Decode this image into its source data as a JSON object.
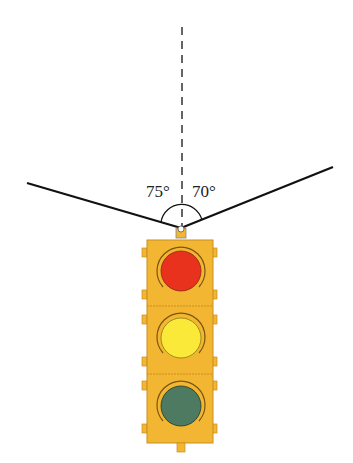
{
  "diagram": {
    "title": "",
    "angles": {
      "left": "75°",
      "right": "70°"
    },
    "elements": {
      "reference_line": "vertical dashed line",
      "left_wire": "cable to left",
      "right_wire": "cable to right",
      "traffic_light": {
        "lights": [
          "red",
          "yellow",
          "green"
        ]
      }
    },
    "colors": {
      "housing": "#F2B632",
      "housing_edge": "#C98E1E",
      "red": "#E8321E",
      "yellow": "#FBE93A",
      "green": "#4F7A62",
      "wire": "#111111"
    }
  }
}
